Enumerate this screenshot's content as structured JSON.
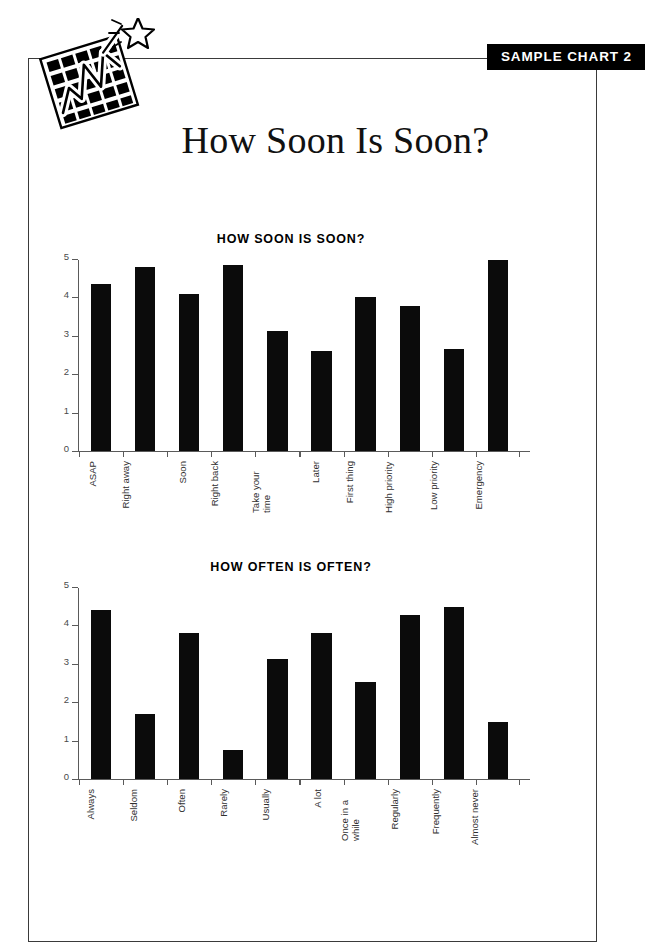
{
  "badge": {
    "label": "SAMPLE CHART 2"
  },
  "page": {
    "title": "How Soon Is Soon?"
  },
  "logo": {
    "name": "chart-star-logo"
  },
  "chart_data": [
    {
      "type": "bar",
      "title": "HOW SOON IS SOON?",
      "xlabel": "",
      "ylabel": "",
      "ylim": [
        0,
        5
      ],
      "yticks": [
        "0",
        "1",
        "2",
        "3",
        "4",
        "5"
      ],
      "grid": false,
      "legend": "none",
      "bar_color": "#0b0b0b",
      "categories": [
        "ASAP",
        "Right away",
        "Soon",
        "Right back",
        "Take your time",
        "Later",
        "First thing",
        "High priority",
        "Low priority",
        "Emergency"
      ],
      "values": [
        4.38,
        4.83,
        4.1,
        4.88,
        3.15,
        2.62,
        4.03,
        3.8,
        2.68,
        5.0
      ]
    },
    {
      "type": "bar",
      "title": "HOW OFTEN IS OFTEN?",
      "xlabel": "",
      "ylabel": "",
      "ylim": [
        0,
        5
      ],
      "yticks": [
        "0",
        "1",
        "2",
        "3",
        "4",
        "5"
      ],
      "grid": false,
      "legend": "none",
      "bar_color": "#0b0b0b",
      "categories": [
        "Always",
        "Seldom",
        "Often",
        "Rarely",
        "Usually",
        "A lot",
        "Once in a while",
        "Regularly",
        "Frequently",
        "Almost never"
      ],
      "values": [
        4.42,
        1.7,
        3.83,
        0.75,
        3.15,
        3.83,
        2.55,
        4.3,
        4.5,
        1.5
      ]
    }
  ]
}
